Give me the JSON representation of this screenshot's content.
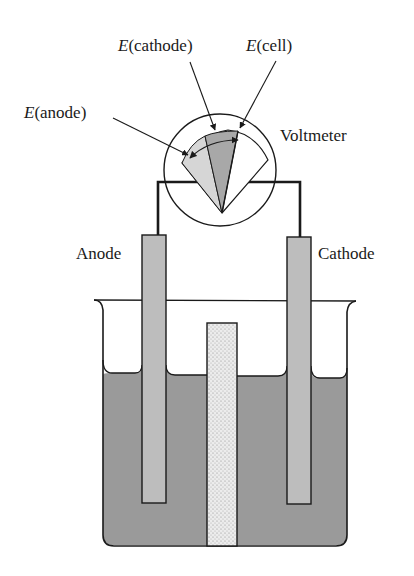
{
  "diagram": {
    "labels": {
      "e_cathode": {
        "symbol": "E",
        "text": "(cathode)"
      },
      "e_cell": {
        "symbol": "E",
        "text": "(cell)"
      },
      "e_anode": {
        "symbol": "E",
        "text": "(anode)"
      },
      "voltmeter": "Voltmeter",
      "anode": "Anode",
      "cathode": "Cathode"
    },
    "colors": {
      "line": "#1a1a1a",
      "electrode_fill": "#bdbdbd",
      "solution_fill": "#9a9a9a",
      "salt_bridge_fill": "#e6e6e6",
      "sector_anode_fill": "#d6d6d6",
      "sector_cathode_fill": "#a8a8a8",
      "background": "#ffffff"
    }
  }
}
